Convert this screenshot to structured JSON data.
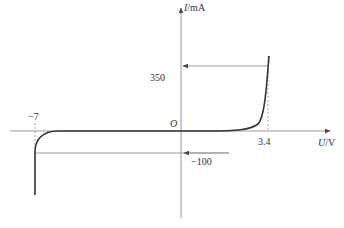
{
  "diagram": {
    "type": "diode I-V characteristic curve",
    "y_axis_label": "I/mA",
    "x_axis_label": "U/V",
    "origin_label": "O",
    "annotations": {
      "forward_current": "350",
      "forward_voltage": "3.4",
      "reverse_breakdown_voltage": "−7",
      "reverse_current": "−100"
    },
    "colors": {
      "axis": "#888888",
      "curve": "#333333",
      "dashed": "#aaaaaa",
      "text": "#333333"
    }
  }
}
